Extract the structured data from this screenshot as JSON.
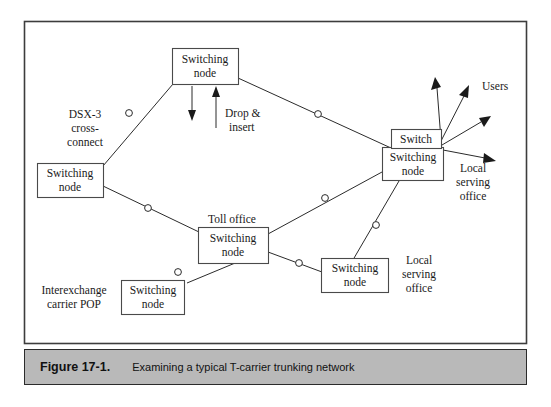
{
  "figure": {
    "caption_number": "Figure 17-1.",
    "caption_text": "Examining a typical T-carrier trunking network"
  },
  "diagram": {
    "type": "network-topology",
    "nodes": [
      {
        "id": "top",
        "label_line1": "Switching",
        "label_line2": "node"
      },
      {
        "id": "left",
        "label_line1": "Switching",
        "label_line2": "node"
      },
      {
        "id": "toll",
        "label_line1": "Switching",
        "label_line2": "node"
      },
      {
        "id": "iec",
        "label_line1": "Switching",
        "label_line2": "node"
      },
      {
        "id": "lso_lower",
        "label_line1": "Switching",
        "label_line2": "node"
      },
      {
        "id": "lso_right",
        "label_line1": "Switching",
        "label_line2": "node"
      },
      {
        "id": "switch",
        "label_line1": "Switch",
        "label_line2": ""
      }
    ],
    "annotations": [
      {
        "id": "dsx3",
        "line1": "DSX-3",
        "line2": "cross-",
        "line3": "connect"
      },
      {
        "id": "drop_insert",
        "line1": "Drop &",
        "line2": "insert"
      },
      {
        "id": "users",
        "line1": "Users"
      },
      {
        "id": "lso_upper",
        "line1": "Local",
        "line2": "serving",
        "line3": "office"
      },
      {
        "id": "toll_office",
        "line1": "Toll office"
      },
      {
        "id": "iec_pop",
        "line1": "Interexchange",
        "line2": "carrier POP"
      },
      {
        "id": "lso_lower_label",
        "line1": "Local",
        "line2": "serving",
        "line3": "office"
      }
    ]
  }
}
